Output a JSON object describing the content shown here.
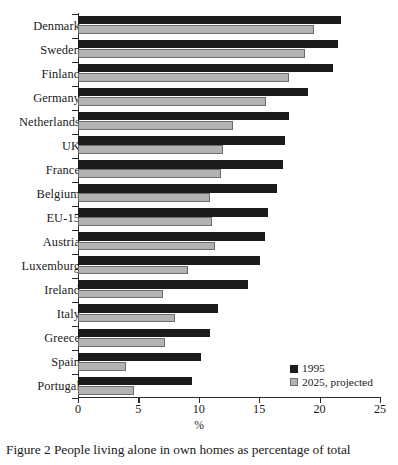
{
  "caption": "Figure 2 People living alone in own homes as percentage of total",
  "legend": {
    "position": "bottom-right",
    "entries": [
      {
        "label": "1995",
        "color": "#1b1b1b",
        "swatch": "legend-swatch-1995"
      },
      {
        "label": "2025, projected",
        "color": "#b3b3b3",
        "swatch": "legend-swatch-2025"
      }
    ]
  },
  "chart_data": {
    "type": "bar",
    "orientation": "horizontal",
    "title": "",
    "subtitle": "",
    "xlabel": "%",
    "ylabel": "",
    "xlim": [
      0,
      25
    ],
    "xticks": [
      0,
      5,
      10,
      15,
      20,
      25
    ],
    "xticklabels": [
      "0",
      "5",
      "10",
      "15",
      "20",
      "25"
    ],
    "grid": false,
    "legend_position": "lower right",
    "categories": [
      "Denmark",
      "Sweden",
      "Finland",
      "Germany",
      "Netherlands",
      "UK",
      "France",
      "Belgium",
      "EU-15",
      "Austria",
      "Luxemburg",
      "Ireland",
      "Italy",
      "Greece",
      "Spain",
      "Portugal"
    ],
    "series": [
      {
        "name": "1995",
        "color": "#1b1b1b",
        "values": [
          21.8,
          21.5,
          21.1,
          19.0,
          17.5,
          17.1,
          17.0,
          16.5,
          15.7,
          15.5,
          15.1,
          14.1,
          11.6,
          10.9,
          10.2,
          9.4
        ]
      },
      {
        "name": "2025, projected",
        "color": "#b3b3b3",
        "values": [
          19.5,
          18.8,
          17.5,
          15.6,
          12.8,
          12.0,
          11.8,
          10.9,
          11.1,
          11.3,
          9.1,
          7.0,
          8.0,
          7.2,
          4.0,
          4.6
        ]
      }
    ]
  }
}
